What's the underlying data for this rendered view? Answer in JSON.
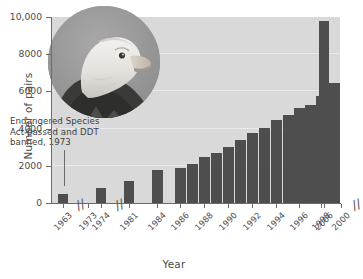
{
  "chart_data": {
    "type": "bar",
    "title": "",
    "xlabel": "Year",
    "ylabel": "Number of pairs",
    "ylim": [
      0,
      10000
    ],
    "yticks": [
      0,
      2000,
      4000,
      6000,
      8000,
      10000
    ],
    "ytick_labels": [
      "0",
      "2000",
      "4000",
      "6000",
      "8000",
      "10,000"
    ],
    "grid": true,
    "legend": "none",
    "axis_breaks": [
      "between 1963 and 1973",
      "between 1974 and 1981",
      "between 2000 and 2006"
    ],
    "categories": [
      "1963",
      "1973",
      "1974",
      "1981",
      "1984",
      "1986",
      "1988",
      "1990",
      "1992",
      "1994",
      "1996",
      "1998",
      "2000",
      "2006"
    ],
    "bars": [
      {
        "year": "1963",
        "value": 487
      },
      {
        "year": "1974",
        "value": 791
      },
      {
        "year": "1981",
        "value": 1188
      },
      {
        "year": "1984",
        "value": 1757
      },
      {
        "year": "1986",
        "value": 1875
      },
      {
        "year": "1987",
        "value": 2075
      },
      {
        "year": "1988",
        "value": 2475
      },
      {
        "year": "1989",
        "value": 2680
      },
      {
        "year": "1990",
        "value": 3035
      },
      {
        "year": "1991",
        "value": 3391
      },
      {
        "year": "1992",
        "value": 3749
      },
      {
        "year": "1993",
        "value": 4015
      },
      {
        "year": "1994",
        "value": 4449
      },
      {
        "year": "1995",
        "value": 4712
      },
      {
        "year": "1996",
        "value": 5094
      },
      {
        "year": "1997",
        "value": 5295
      },
      {
        "year": "1998",
        "value": 5748
      },
      {
        "year": "1999",
        "value": 6471
      },
      {
        "year": "2000",
        "value": 6471
      },
      {
        "year": "2006",
        "value": 9789
      }
    ]
  },
  "annotation": {
    "line1": "Endangered Species",
    "line2": "Act passed and DDT",
    "line3": "banned, 1973"
  },
  "photo": {
    "alt": "bald-eagle-photo"
  },
  "colors": {
    "bar": "#4e4e4e",
    "plot_background": "#d9d9d9",
    "gridline": "#ececec",
    "axis": "#6b6b6b",
    "text": "#4a4a4a"
  }
}
